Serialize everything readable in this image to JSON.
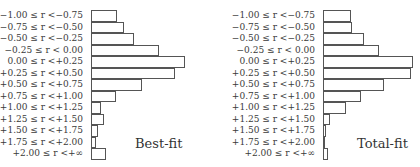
{
  "chart_data": [
    {
      "type": "bar",
      "orientation": "horizontal",
      "title": "Best-fit",
      "categories": [
        "-1.00 ≤ r < -0.75",
        "-0.75 ≤ r < -0.50",
        "-0.50 ≤ r < -0.25",
        "-0.25 ≤ r < 0.00",
        "0.00 ≤ r < +0.25",
        "+0.25 ≤ r < +0.50",
        "+0.50 ≤ r < +0.75",
        "+0.75 ≤ r < +1.00",
        "+1.00 ≤ r < +1.25",
        "+1.25 ≤ r < +1.50",
        "+1.50 ≤ r < +1.75",
        "+1.75 ≤ r < +2.00",
        "+2.00 ≤ r < +∞"
      ],
      "values": [
        26,
        33,
        43,
        68,
        94,
        84,
        51,
        25,
        10,
        13,
        7,
        5,
        15
      ],
      "xlabel": "",
      "ylabel": "",
      "grid": false,
      "axis_ticks": false
    },
    {
      "type": "bar",
      "orientation": "horizontal",
      "title": "Total-fit",
      "categories": [
        "-1.00 ≤ r < -0.75",
        "-0.75 ≤ r < -0.50",
        "-0.50 ≤ r < -0.25",
        "-0.25 ≤ r < 0.00",
        "0.00 ≤ r < +0.25",
        "+0.25 ≤ r < +0.50",
        "+0.50 ≤ r < +0.75",
        "+0.75 ≤ r < +1.00",
        "+1.00 ≤ r < +1.25",
        "+1.25 ≤ r < +1.50",
        "+1.50 ≤ r < +1.75",
        "+1.75 ≤ r < +2.00",
        "+2.00 ≤ r < +∞"
      ],
      "values": [
        28,
        29,
        41,
        56,
        90,
        88,
        61,
        38,
        23,
        7,
        3,
        2,
        5
      ],
      "xlabel": "",
      "ylabel": "",
      "grid": false,
      "axis_ticks": false
    }
  ],
  "panels": [
    {
      "fit_label": "Best-fit",
      "labels": [
        "−1.00 ≤ r <−0.75",
        "−0.75 ≤ r <−0.50",
        "−0.50 ≤ r <−0.25",
        "−0.25 ≤ r <  0.00",
        "0.00 ≤ r <+0.25",
        "+0.25 ≤ r <+0.50",
        "+0.50 ≤ r <+0.75",
        "+0.75 ≤ r <+1.00",
        "+1.00 ≤ r <+1.25",
        "+1.25 ≤ r <+1.50",
        "+1.50 ≤ r <+1.75",
        "+1.75 ≤ r <+2.00",
        "+2.00 ≤ r <+∞"
      ]
    },
    {
      "fit_label": "Total-fit",
      "labels": [
        "−1.00 ≤ r <−0.75",
        "−0.75 ≤ r <−0.50",
        "−0.50 ≤ r <−0.25",
        "−0.25 ≤ r <  0.00",
        "0.00 ≤ r <+0.25",
        "+0.25 ≤ r <+0.50",
        "+0.50 ≤ r <+0.75",
        "+0.75 ≤ r <+1.00",
        "+1.00 ≤ r <+1.25",
        "+1.25 ≤ r <+1.50",
        "+1.50 ≤ r <+1.75",
        "+1.75 ≤ r <+2.00",
        "+2.00 ≤ r <+∞"
      ]
    }
  ]
}
